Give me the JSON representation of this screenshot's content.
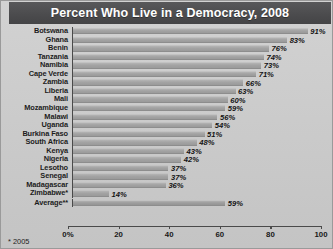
{
  "header": {
    "title": "Percent Who Live in a Democracy, 2008"
  },
  "footnote": {
    "text": "* 2005"
  },
  "axis": {
    "tick_labels": [
      "0%",
      "20",
      "40",
      "60",
      "80",
      "100"
    ],
    "tick_values": [
      0,
      20,
      40,
      60,
      80,
      100
    ]
  },
  "chart_data": {
    "type": "bar",
    "orientation": "horizontal",
    "title": "Percent Who Live in a Democracy, 2008",
    "xlabel": "",
    "ylabel": "",
    "xlim": [
      0,
      100
    ],
    "grid": false,
    "legend": "none",
    "value_suffix": "%",
    "categories": [
      "Botswana",
      "Ghana",
      "Benin",
      "Tanzania",
      "Namibia",
      "Cape Verde",
      "Zambia",
      "Liberia",
      "Mali",
      "Mozambique",
      "Malawi",
      "Uganda",
      "Burkina Faso",
      "South Africa",
      "Kenya",
      "Nigeria",
      "Lesotho",
      "Senegal",
      "Madagascar",
      "Zimbabwe*",
      "Average**"
    ],
    "values": [
      91,
      83,
      76,
      74,
      73,
      71,
      66,
      63,
      60,
      59,
      56,
      54,
      51,
      48,
      43,
      42,
      37,
      37,
      36,
      14,
      59
    ],
    "value_labels": [
      "91%",
      "83%",
      "76%",
      "74%",
      "73%",
      "71%",
      "66%",
      "63%",
      "60%",
      "59%",
      "56%",
      "54%",
      "51%",
      "48%",
      "43%",
      "42%",
      "37%",
      "37%",
      "36%",
      "14%",
      "59%"
    ],
    "annotations": [
      "* 2005"
    ]
  },
  "colors": {
    "title_band": "#4b4b4d",
    "title_text": "#ffffff",
    "background": "#cccccc",
    "bar": "#a3a3a3",
    "axis": "#4a4a4a",
    "text": "#1c1c1c"
  }
}
